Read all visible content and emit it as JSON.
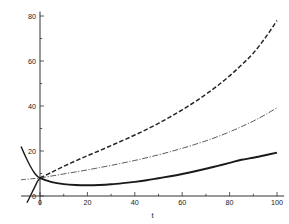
{
  "chart_data": {
    "type": "line",
    "title": "",
    "subtitle": "",
    "xlabel": "t",
    "ylabel": "",
    "xlim": [
      -8,
      103
    ],
    "ylim": [
      -4,
      82
    ],
    "grid": false,
    "legend": "none",
    "xticks": [
      0,
      20,
      40,
      60,
      80,
      100
    ],
    "xticklabels": [
      "0",
      "20",
      "40",
      "60",
      "80",
      "100"
    ],
    "yticks": [
      0,
      20,
      40,
      60,
      80
    ],
    "yticklabels": [
      "0",
      "20",
      "40",
      "60",
      "80"
    ],
    "minor_xticks": [
      10,
      30,
      50,
      70,
      90
    ],
    "minor_yticks": [
      10,
      30,
      50,
      70
    ],
    "series": [
      {
        "name": "upper-dashed-curve",
        "style": "dashed",
        "color": "#252525",
        "x": [
          0,
          5,
          10,
          15,
          20,
          25,
          30,
          35,
          40,
          45,
          50,
          55,
          60,
          65,
          70,
          75,
          80,
          85,
          90,
          95,
          100
        ],
        "values": [
          8.0,
          10.6,
          13.2,
          15.6,
          17.9,
          20.1,
          22.4,
          24.7,
          27.1,
          29.6,
          32.3,
          35.2,
          38.3,
          41.6,
          45.2,
          49.1,
          53.4,
          58.2,
          63.5,
          70.2,
          78.0
        ]
      },
      {
        "name": "middle-dashdot-curve",
        "style": "dash-dot",
        "color": "#4a4a4a",
        "x": [
          0,
          5,
          10,
          15,
          20,
          25,
          30,
          35,
          40,
          45,
          50,
          55,
          60,
          65,
          70,
          75,
          80,
          85,
          90,
          95,
          100
        ],
        "values": [
          8.0,
          8.9,
          9.8,
          10.7,
          11.6,
          12.6,
          13.6,
          14.7,
          15.8,
          17.0,
          18.3,
          19.7,
          21.2,
          22.8,
          24.5,
          26.4,
          28.5,
          30.8,
          33.3,
          36.1,
          39.2
        ]
      },
      {
        "name": "lower-solid-curve",
        "style": "solid",
        "color": "#1a1a1a",
        "x": [
          0,
          5,
          10,
          15,
          20,
          25,
          30,
          35,
          40,
          45,
          50,
          55,
          60,
          65,
          70,
          75,
          80,
          85,
          90,
          95,
          100
        ],
        "values": [
          8.0,
          6.2,
          5.3,
          4.9,
          4.8,
          4.9,
          5.2,
          5.7,
          6.3,
          7.0,
          7.9,
          8.8,
          9.8,
          10.9,
          12.1,
          13.4,
          14.7,
          16.1,
          17.0,
          18.1,
          19.3
        ]
      },
      {
        "name": "left-descending-branch",
        "style": "solid",
        "color": "#1a1a1a",
        "x": [
          -8.0,
          -7.0,
          -6.0,
          -5.0,
          -4.0,
          -3.0,
          -2.0,
          -1.0,
          0.0
        ],
        "values": [
          22.0,
          19.6,
          17.3,
          15.1,
          13.1,
          11.3,
          9.8,
          8.7,
          8.0
        ]
      },
      {
        "name": "left-ascending-line",
        "style": "solid",
        "color": "#1a1a1a",
        "x": [
          -5.5,
          -4.0,
          -2.5,
          -1.0,
          0.0
        ],
        "values": [
          -3.0,
          0.2,
          3.4,
          6.6,
          8.0
        ]
      },
      {
        "name": "left-flat-dashdot",
        "style": "dash-dot",
        "color": "#4a4a4a",
        "x": [
          -8.0,
          -6.0,
          -4.0,
          -2.0,
          0.0
        ],
        "values": [
          7.2,
          7.4,
          7.6,
          7.8,
          8.0
        ]
      }
    ]
  }
}
